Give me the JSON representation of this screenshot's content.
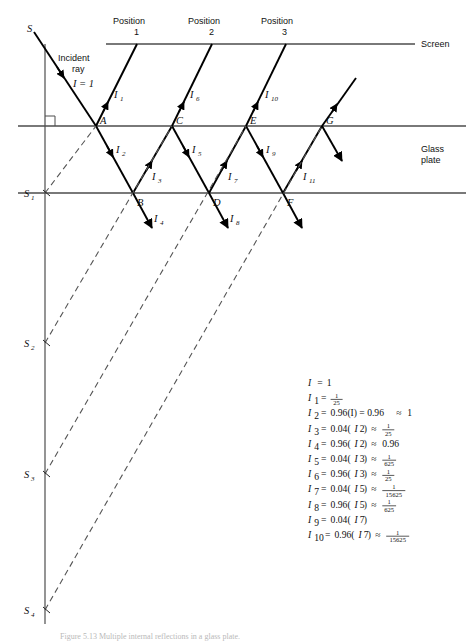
{
  "figure": {
    "caption": "Figure 5.13  Multiple internal reflections in a glass plate.",
    "surfaces": {
      "screen_label": "Screen",
      "glass_label_line1": "Glass",
      "glass_label_line2": "plate"
    },
    "annotations": {
      "incident_line1": "Incident",
      "incident_line2": "ray",
      "incident_intensity": "I = 1",
      "source_label": "S"
    },
    "positions": [
      {
        "word": "Position",
        "number": "1"
      },
      {
        "word": "Position",
        "number": "2"
      },
      {
        "word": "Position",
        "number": "3"
      }
    ],
    "interface_points": [
      "A",
      "B",
      "C",
      "D",
      "E",
      "F",
      "G"
    ],
    "virtual_sources": [
      "S",
      "1",
      "2",
      "3",
      "4"
    ],
    "ray_labels": [
      {
        "base": "I",
        "sub": "1"
      },
      {
        "base": "I",
        "sub": "2"
      },
      {
        "base": "I",
        "sub": "3"
      },
      {
        "base": "I",
        "sub": "4"
      },
      {
        "base": "I",
        "sub": "5"
      },
      {
        "base": "I",
        "sub": "6"
      },
      {
        "base": "I",
        "sub": "7"
      },
      {
        "base": "I",
        "sub": "8"
      },
      {
        "base": "I",
        "sub": "9"
      },
      {
        "base": "I",
        "sub": "10"
      },
      {
        "base": "I",
        "sub": "11"
      }
    ]
  },
  "chart_data": {
    "type": "diagram",
    "equations": [
      {
        "lhs": "I",
        "lhs_sub": "",
        "rhs": "1",
        "approx": "",
        "approx_frac": null
      },
      {
        "lhs": "I",
        "lhs_sub": "1",
        "rhs": "",
        "approx": "",
        "approx_frac": {
          "num": "1",
          "den": "25"
        },
        "rhs_is_frac": true
      },
      {
        "lhs": "I",
        "lhs_sub": "2",
        "rhs": "0.96(I) = 0.96",
        "approx": "1",
        "approx_frac": null
      },
      {
        "lhs": "I",
        "lhs_sub": "3",
        "rhs": "0.04(I2)",
        "rhs_arg": "2",
        "approx_frac": {
          "num": "1",
          "den": "25"
        }
      },
      {
        "lhs": "I",
        "lhs_sub": "4",
        "rhs": "0.96(I2)",
        "rhs_arg": "2",
        "approx": "0.96",
        "approx_frac": null
      },
      {
        "lhs": "I",
        "lhs_sub": "5",
        "rhs": "0.04(I3)",
        "rhs_arg": "3",
        "approx_frac": {
          "num": "1",
          "den": "625"
        }
      },
      {
        "lhs": "I",
        "lhs_sub": "6",
        "rhs": "0.96(I3)",
        "rhs_arg": "3",
        "approx_frac": {
          "num": "1",
          "den": "25"
        }
      },
      {
        "lhs": "I",
        "lhs_sub": "7",
        "rhs": "0.04(I5)",
        "rhs_arg": "5",
        "approx_frac": {
          "num": "1",
          "den": "15625"
        }
      },
      {
        "lhs": "I",
        "lhs_sub": "8",
        "rhs": "0.96(I5)",
        "rhs_arg": "5",
        "approx_frac": {
          "num": "1",
          "den": "625"
        }
      },
      {
        "lhs": "I",
        "lhs_sub": "9",
        "rhs": "0.04(I7)",
        "rhs_arg": "7",
        "approx": "",
        "approx_frac": null
      },
      {
        "lhs": "I",
        "lhs_sub": "10",
        "rhs": "0.96(I7)",
        "rhs_arg": "7",
        "approx_frac": {
          "num": "1",
          "den": "15625"
        }
      }
    ],
    "coefficients": {
      "transmission": 0.96,
      "reflection": 0.04
    }
  },
  "colors": {
    "ink": "#111111",
    "ray": "#000000",
    "surface": "#4d4d4d",
    "dashed": "#555555",
    "background": "#ffffff"
  }
}
